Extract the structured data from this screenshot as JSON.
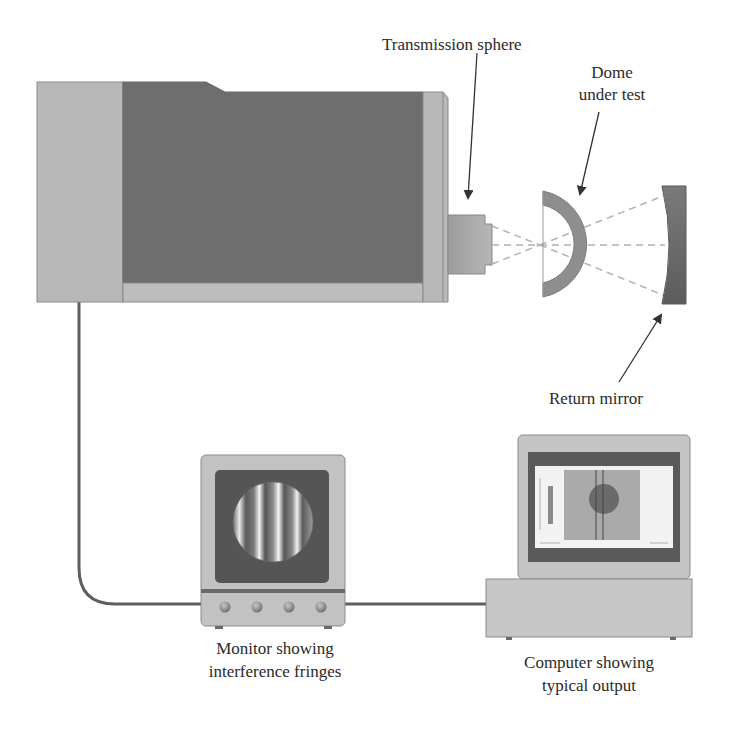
{
  "figure": {
    "type": "interferometer-setup-diagram",
    "labels": {
      "transmission_sphere": "Transmission sphere",
      "dome_line1": "Dome",
      "dome_line2": "under test",
      "return_mirror": "Return mirror",
      "monitor_line1": "Monitor showing",
      "monitor_line2": "interference fringes",
      "computer_line1": "Computer showing",
      "computer_line2": "typical output"
    },
    "components": [
      {
        "id": "interferometer",
        "shape": "box"
      },
      {
        "id": "transmission-sphere",
        "shape": "stepped-cylinder"
      },
      {
        "id": "dome",
        "shape": "half-shell"
      },
      {
        "id": "return-mirror",
        "shape": "concave-block"
      },
      {
        "id": "monitor",
        "knobs": 4,
        "fringes": 4
      },
      {
        "id": "computer",
        "shape": "display-on-base"
      }
    ],
    "colors": {
      "body_light": "#b8b8b8",
      "body_dark": "#6e6e6e",
      "outline": "#8a8a8a",
      "cable": "#5e5e5e",
      "beam": "#b0b0b0",
      "screen_dark": "#555555",
      "text": "#2a2a2a",
      "arrow": "#333333"
    }
  }
}
